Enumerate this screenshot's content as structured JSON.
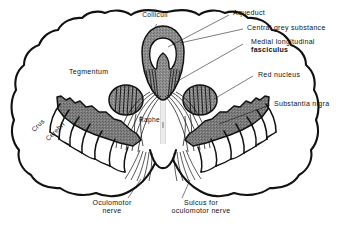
{
  "figure": {
    "type": "anatomical-line-diagram",
    "background_color": "#ffffff",
    "ink_color": "#111111",
    "shading_color": "#8a8a8a",
    "shading_color_dark": "#787878",
    "white_fill": "#ffffff"
  },
  "labels": {
    "colliculi": "Colliculi",
    "aqueduct": "Aqueduct",
    "central_grey_substance": "Central grey substance",
    "mlf_line1": "Medial longitudinal",
    "mlf_line2": "fasciculus",
    "red_nucleus": "Red nucleus",
    "substantia_nigra": "Substantia nigra",
    "tegmentum": "Tegmentum",
    "raphe": "Raphe",
    "crus_cerebri_line1": "Crus",
    "crus_cerebri_line2": "Cerebri",
    "oculomotor_nerve_line1": "Oculomotor",
    "oculomotor_nerve_line2": "nerve",
    "sulcus_line1": "Sulcus for",
    "sulcus_line2": "oculomotor nerve"
  },
  "structures": [
    {
      "name": "midbrain-outline",
      "label": "Midbrain outline",
      "fill": "#ffffff"
    },
    {
      "name": "central-grey-substance",
      "label": "Central grey substance",
      "fill": "#8a8a8a"
    },
    {
      "name": "aqueduct",
      "label": "Aqueduct",
      "fill": "#ffffff"
    },
    {
      "name": "red-nucleus-left",
      "label": "Red nucleus (left)",
      "fill": "#8a8a8a"
    },
    {
      "name": "red-nucleus-right",
      "label": "Red nucleus (right)",
      "fill": "#8a8a8a"
    },
    {
      "name": "substantia-nigra-left",
      "label": "Substantia nigra (left)",
      "fill": "#787878"
    },
    {
      "name": "substantia-nigra-right",
      "label": "Substantia nigra (right)",
      "fill": "#787878"
    },
    {
      "name": "crus-cerebri-left",
      "label": "Crus cerebri (left)",
      "fill": "#ffffff"
    },
    {
      "name": "crus-cerebri-right",
      "label": "Crus cerebri (right)",
      "fill": "#ffffff"
    },
    {
      "name": "medial-longitudinal-fasciculus",
      "label": "Medial longitudinal fasciculus",
      "fill": "#8a8a8a"
    },
    {
      "name": "raphe",
      "label": "Raphe",
      "fill": "#e8e8e8"
    },
    {
      "name": "oculomotor-nerve-fibres",
      "label": "Oculomotor nerve fibres",
      "fill": "none"
    },
    {
      "name": "interpeduncular-fossa",
      "label": "Interpeduncular fossa",
      "fill": "#ffffff"
    }
  ]
}
